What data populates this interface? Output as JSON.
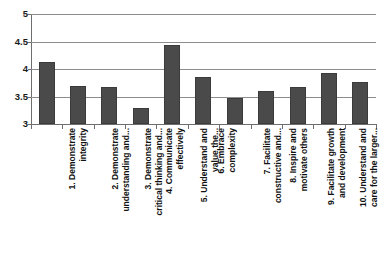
{
  "chart_data": {
    "type": "bar",
    "title": "",
    "subtitle": "",
    "xlabel": "",
    "ylabel": "",
    "ylim": [
      3,
      5
    ],
    "ytick_values": [
      3,
      3.5,
      4,
      4.5,
      5
    ],
    "ytick_labels": [
      "3",
      "3.5",
      "4",
      "4.5",
      "5"
    ],
    "grid": true,
    "legend": false,
    "legend_position": "none",
    "bar_color": "#4a4a4a",
    "gridline_color": "#8d8d8d",
    "axis_color": "#6e6e6e",
    "background_color": "#ffffff",
    "categories": [
      "1. Demonstrate\nintegrity",
      "2. Demonstrate\nunderstanding and...",
      "3. Demonstrate\ncritical thinking and...",
      "4. Communicate\neffectively",
      "5. Understand and\nvalue the...",
      "6. Embrace\ncomplexity",
      "7. Facilitate\nconstructive and...",
      "8. Inspire and\nmotivate others",
      "9. Facilitate growth\nand development",
      "10. Understand and\ncare for the larger...",
      "A. WORK BEHAVIORS"
    ],
    "values": [
      4.12,
      3.69,
      3.68,
      3.3,
      4.43,
      3.86,
      3.48,
      3.6,
      3.67,
      3.92,
      3.76
    ]
  }
}
